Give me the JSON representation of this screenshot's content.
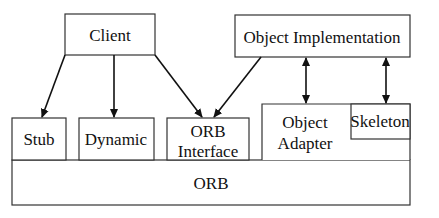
{
  "diagram": {
    "nodes": {
      "client": "Client",
      "object_implementation": "Object Implementation",
      "stub": "Stub",
      "dynamic": "Dynamic",
      "orb_interface_line1": "ORB",
      "orb_interface_line2": "Interface",
      "object_adapter_line1": "Object",
      "object_adapter_line2": "Adapter",
      "skeleton": "Skeleton",
      "orb": "ORB"
    },
    "edges": [
      {
        "from": "Client",
        "to": "Stub",
        "type": "directed"
      },
      {
        "from": "Client",
        "to": "Dynamic",
        "type": "directed"
      },
      {
        "from": "Client",
        "to": "ORB Interface",
        "type": "directed"
      },
      {
        "from": "Object Implementation",
        "to": "ORB Interface",
        "type": "directed"
      },
      {
        "from": "Object Implementation",
        "to": "Object Adapter",
        "type": "bidirectional"
      },
      {
        "from": "Object Implementation",
        "to": "Skeleton",
        "type": "bidirectional"
      }
    ]
  }
}
